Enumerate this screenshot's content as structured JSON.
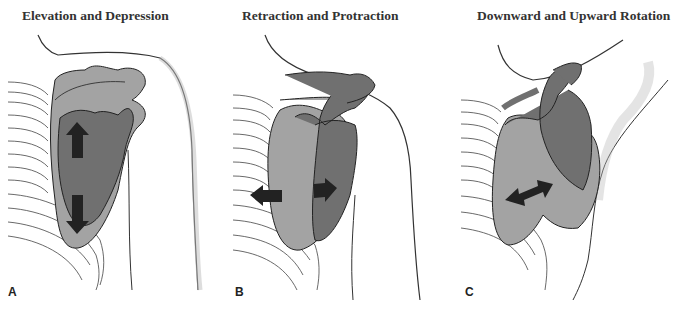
{
  "panels": [
    {
      "id": "A",
      "title": "Elevation and Depression",
      "label": "A",
      "arrows": [
        "up",
        "down"
      ]
    },
    {
      "id": "B",
      "title": "Retraction and Protraction",
      "label": "B",
      "arrows": [
        "left",
        "right"
      ]
    },
    {
      "id": "C",
      "title": "Downward and Upward Rotation",
      "label": "C",
      "arrows": [
        "double-diagonal"
      ]
    }
  ],
  "colors": {
    "scapula_light": "#a3a3a3",
    "scapula_dark": "#707070",
    "arrow": "#222222",
    "outline": "#222222",
    "text": "#333333"
  }
}
